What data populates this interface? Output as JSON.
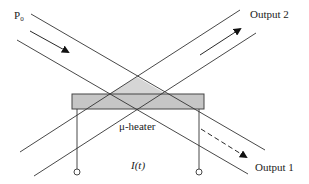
{
  "diagram": {
    "type": "optical-switch-schematic",
    "labels": {
      "input": "P",
      "input_subscript": "0",
      "output2": "Output 2",
      "output1": "Output 1",
      "heater": "μ-heater",
      "current": "I(t)"
    },
    "colors": {
      "line": "#333333",
      "heater_fill": "#c8c8c8",
      "heater_overlap_fill": "#d4d4d4",
      "background": "#ffffff"
    }
  }
}
